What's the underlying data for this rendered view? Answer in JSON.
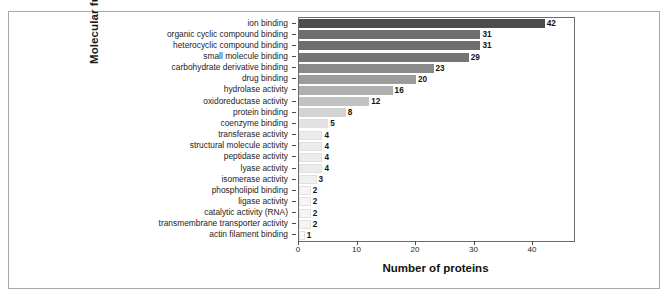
{
  "figure": {
    "background_color": "#ffffff",
    "frame_color": "#a8a8a8",
    "axis_color": "#6b6b6b"
  },
  "chart_data": {
    "type": "bar",
    "orientation": "horizontal",
    "title": "",
    "xlabel": "Number of proteins",
    "ylabel": "Molecular function",
    "xlim": [
      0,
      47
    ],
    "xticks": [
      0,
      10,
      20,
      30,
      40
    ],
    "xtick_labels": [
      "0",
      "10",
      "20",
      "30",
      "40"
    ],
    "grid": false,
    "legend": null,
    "show_value_labels": true,
    "categories": [
      "ion binding",
      "organic cyclic compound binding",
      "heterocyclic compound binding",
      "small molecule binding",
      "carbohydrate derivative binding",
      "drug binding",
      "hydrolase activity",
      "oxidoreductase activity",
      "protein binding",
      "coenzyme binding",
      "transferase activity",
      "structural molecule activity",
      "peptidase activity",
      "lyase activity",
      "isomerase activity",
      "phospholipid binding",
      "ligase activity",
      "catalytic activity (RNA)",
      "transmembrane transporter activity",
      "actin filament binding"
    ],
    "values": [
      42,
      31,
      31,
      29,
      23,
      20,
      16,
      12,
      8,
      5,
      4,
      4,
      4,
      4,
      3,
      2,
      2,
      2,
      2,
      1
    ],
    "bar_colors": [
      "#4d4d4d",
      "#6e6e6e",
      "#6e6e6e",
      "#757575",
      "#8a8a8a",
      "#9c9c9c",
      "#b0b0b0",
      "#c2c2c2",
      "#d3d3d3",
      "#e2e2e2",
      "#ebebeb",
      "#ebebeb",
      "#ebebeb",
      "#ebebeb",
      "#f0f0f0",
      "#f5f5f5",
      "#f5f5f5",
      "#f5f5f5",
      "#f5f5f5",
      "#fafafa"
    ]
  }
}
